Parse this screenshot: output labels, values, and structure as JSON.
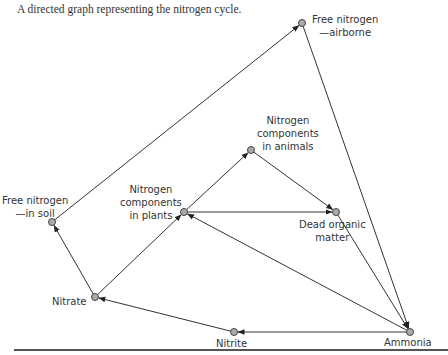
{
  "caption": "A directed graph representing the nitrogen cycle.",
  "nodes": {
    "airborne": {
      "label1": "Free nitrogen",
      "label2": "—airborne",
      "x": 302,
      "y": 23
    },
    "soil": {
      "label1": "Free nitrogen",
      "label2": "—in soil",
      "x": 52,
      "y": 222
    },
    "plants": {
      "label1": "Nitrogen",
      "label2": "components",
      "label3": "in plants",
      "x": 184,
      "y": 212
    },
    "animals": {
      "label1": "Nitrogen",
      "label2": "components",
      "label3": "in animals",
      "x": 251,
      "y": 150
    },
    "dead": {
      "label1": "Dead organic",
      "label2": "matter",
      "x": 336,
      "y": 212
    },
    "ammonia": {
      "label1": "Ammonia",
      "x": 410,
      "y": 332
    },
    "nitrate": {
      "label1": "Nitrate",
      "x": 95,
      "y": 297
    },
    "nitrite": {
      "label1": "Nitrite",
      "x": 234,
      "y": 332
    }
  },
  "edges": [
    [
      "nitrate",
      "soil"
    ],
    [
      "soil",
      "airborne"
    ],
    [
      "airborne",
      "ammonia"
    ],
    [
      "nitrate",
      "plants"
    ],
    [
      "plants",
      "animals"
    ],
    [
      "plants",
      "dead"
    ],
    [
      "animals",
      "dead"
    ],
    [
      "dead",
      "ammonia"
    ],
    [
      "ammonia",
      "plants"
    ],
    [
      "ammonia",
      "nitrite"
    ],
    [
      "nitrite",
      "nitrate"
    ]
  ]
}
